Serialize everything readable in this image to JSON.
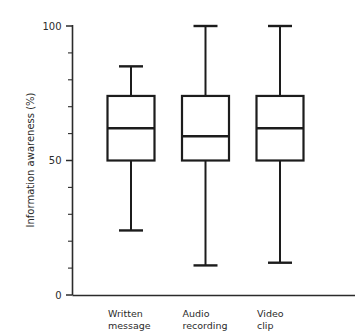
{
  "figure": {
    "scan_artifact_text": "",
    "background_color": "#ffffff",
    "ink_color": "#1c1c1c"
  },
  "chart_data": {
    "type": "box",
    "title": "",
    "subtitle": "",
    "xlabel": "",
    "ylabel": "Information awareness (%)",
    "ylim": [
      0,
      100
    ],
    "grid": false,
    "legend": "none",
    "y_ticks_major": [
      0,
      50,
      100
    ],
    "y_tick_labels_major": [
      "0",
      "50",
      "100"
    ],
    "y_ticks_minor": [
      10,
      20,
      30,
      40,
      60,
      70,
      80,
      90
    ],
    "categories": [
      "Written message",
      "Audio recording",
      "Video clip"
    ],
    "category_labels_line1": [
      "Written",
      "Audio",
      "Video"
    ],
    "category_labels_line2": [
      "message",
      "recording",
      "clip"
    ],
    "boxes": [
      {
        "category": "Written message",
        "whisker_low": 24,
        "q1": 50,
        "median": 62,
        "q3": 74,
        "whisker_high": 85
      },
      {
        "category": "Audio recording",
        "whisker_low": 11,
        "q1": 50,
        "median": 59,
        "q3": 74,
        "whisker_high": 100
      },
      {
        "category": "Video clip",
        "whisker_low": 12,
        "q1": 50,
        "median": 62,
        "q3": 74,
        "whisker_high": 100
      }
    ]
  }
}
